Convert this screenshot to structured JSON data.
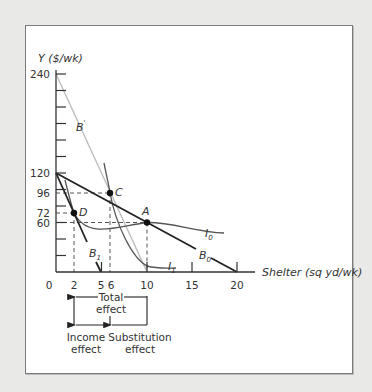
{
  "figure": {
    "y_axis_title": "Y ($/wk)",
    "x_axis_title": "Shelter (sq yd/wk)",
    "y_ticks": [
      {
        "label": "240",
        "value": 240
      },
      {
        "label": "120",
        "value": 120
      },
      {
        "label": "96",
        "value": 96
      },
      {
        "label": "72",
        "value": 72
      },
      {
        "label": "60",
        "value": 60
      }
    ],
    "y_minor_ticks": [
      20,
      40,
      140,
      160,
      180,
      200,
      220
    ],
    "x_ticks": [
      {
        "label": "0",
        "value": 0
      },
      {
        "label": "2",
        "value": 2
      },
      {
        "label": "5",
        "value": 5
      },
      {
        "label": "6",
        "value": 6
      },
      {
        "label": "10",
        "value": 10
      },
      {
        "label": "15",
        "value": 15
      },
      {
        "label": "20",
        "value": 20
      }
    ],
    "budget_lines": [
      {
        "name": "B0",
        "label_main": "B",
        "label_sub": "0",
        "from": [
          0,
          120
        ],
        "to": [
          20,
          0
        ],
        "color": "#222222"
      },
      {
        "name": "B1",
        "label_main": "B",
        "label_sub": "1",
        "from": [
          0,
          120
        ],
        "to": [
          5,
          0
        ],
        "color": "#222222"
      },
      {
        "name": "B'",
        "label_main": "B",
        "label_sup": "'",
        "from": [
          0,
          240
        ],
        "to": [
          10,
          0
        ],
        "color": "#b8b8b8"
      }
    ],
    "indifference_curves": [
      {
        "name": "I0",
        "label_main": "I",
        "label_sub": "0",
        "passes_through": [
          "D",
          "A"
        ],
        "color": "#444444"
      },
      {
        "name": "I1",
        "label_main": "I",
        "label_sub": "1",
        "passes_through": [
          "C"
        ],
        "color": "#444444"
      }
    ],
    "points": [
      {
        "name": "A",
        "x": 10,
        "y": 60
      },
      {
        "name": "C",
        "x": 6,
        "y": 96
      },
      {
        "name": "D",
        "x": 2,
        "y": 72
      }
    ],
    "bracket": {
      "total_line1": "Total",
      "total_line2": "effect",
      "income_line1": "Income",
      "income_line2": "effect",
      "substitution_line1": "Substitution",
      "substitution_line2": "effect",
      "total_range": [
        10,
        2
      ],
      "income_range": [
        6,
        2
      ],
      "substitution_range": [
        10,
        6
      ]
    }
  }
}
